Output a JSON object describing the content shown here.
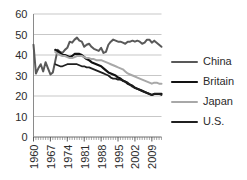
{
  "chart_data": {
    "type": "line",
    "title": "",
    "subtitle": "",
    "xlabel": "",
    "ylabel": "",
    "ylim": [
      0,
      60
    ],
    "ytick_values": [
      0,
      10,
      20,
      30,
      40,
      50,
      60
    ],
    "ytick_labels": [
      "0",
      "10",
      "20",
      "30",
      "40",
      "50",
      "60"
    ],
    "xlim": [
      1960,
      2013
    ],
    "xtick_labels": [
      "1960",
      "1967",
      "1974",
      "1981",
      "1988",
      "1995",
      "2002",
      "2009"
    ],
    "xtick_values": [
      1960,
      1967,
      1974,
      1981,
      1988,
      1995,
      2002,
      2009
    ],
    "x": [
      1960,
      1961,
      1962,
      1963,
      1964,
      1965,
      1966,
      1967,
      1968,
      1969,
      1970,
      1971,
      1972,
      1973,
      1974,
      1975,
      1976,
      1977,
      1978,
      1979,
      1980,
      1981,
      1982,
      1983,
      1984,
      1985,
      1986,
      1987,
      1988,
      1989,
      1990,
      1991,
      1992,
      1993,
      1994,
      1995,
      1996,
      1997,
      1998,
      1999,
      2000,
      2001,
      2002,
      2003,
      2004,
      2005,
      2006,
      2007,
      2008,
      2009,
      2010,
      2011,
      2012,
      2013
    ],
    "grid": "horizontal",
    "legend_position": "right",
    "series": [
      {
        "name": "China",
        "color": "#595959",
        "width": 2.0,
        "values": [
          45.0,
          31.0,
          33.5,
          35.5,
          32.0,
          36.5,
          33.5,
          30.5,
          31.5,
          37.0,
          42.5,
          41.5,
          41.0,
          42.5,
          43.5,
          46.5,
          46.0,
          47.5,
          48.5,
          47.0,
          46.5,
          44.0,
          45.0,
          45.5,
          44.0,
          43.0,
          42.5,
          42.0,
          43.5,
          41.0,
          41.5,
          45.0,
          46.5,
          47.5,
          47.0,
          46.5,
          46.5,
          46.0,
          45.5,
          46.5,
          46.5,
          47.0,
          46.5,
          47.0,
          46.5,
          45.5,
          46.0,
          47.5,
          47.5,
          46.0,
          47.0,
          46.0,
          45.0,
          44.0
        ]
      },
      {
        "name": "Britain",
        "color": "#121212",
        "width": 2.2,
        "values": [
          null,
          null,
          null,
          null,
          null,
          null,
          null,
          null,
          null,
          42.5,
          42.0,
          41.0,
          40.0,
          40.0,
          39.5,
          39.0,
          39.5,
          40.5,
          40.5,
          40.5,
          40.0,
          39.0,
          38.0,
          37.5,
          36.5,
          36.0,
          35.5,
          35.0,
          34.5,
          33.5,
          32.5,
          31.5,
          31.0,
          30.5,
          30.0,
          29.0,
          28.5,
          27.5,
          27.0,
          26.0,
          25.5,
          25.0,
          24.0,
          23.5,
          23.0,
          22.5,
          22.0,
          21.5,
          21.0,
          20.5,
          21.0,
          21.0,
          21.0,
          21.0
        ]
      },
      {
        "name": "Japan",
        "color": "#a8a8a8",
        "width": 2.0,
        "values": [
          null,
          null,
          null,
          null,
          null,
          null,
          null,
          null,
          null,
          41.5,
          40.5,
          40.0,
          39.5,
          39.5,
          39.0,
          38.5,
          38.5,
          39.0,
          39.5,
          39.5,
          39.5,
          39.0,
          38.5,
          38.5,
          38.0,
          38.0,
          37.5,
          37.5,
          37.5,
          37.0,
          36.5,
          36.0,
          35.5,
          35.0,
          34.5,
          34.0,
          33.5,
          33.0,
          32.0,
          31.0,
          30.5,
          30.0,
          29.5,
          29.0,
          28.5,
          28.0,
          27.5,
          27.0,
          26.5,
          26.0,
          26.5,
          26.5,
          26.0,
          26.0
        ]
      },
      {
        "name": "U.S.",
        "color": "#1f1f1f",
        "width": 1.8,
        "values": [
          null,
          null,
          null,
          null,
          null,
          null,
          null,
          null,
          null,
          35.5,
          35.0,
          34.5,
          34.5,
          35.0,
          35.5,
          35.5,
          35.5,
          35.5,
          35.5,
          35.0,
          34.5,
          34.5,
          34.0,
          34.0,
          33.5,
          33.0,
          32.5,
          32.0,
          31.5,
          31.0,
          30.5,
          30.0,
          29.0,
          28.5,
          28.5,
          28.0,
          28.0,
          27.5,
          27.0,
          26.5,
          25.5,
          24.5,
          24.0,
          23.5,
          23.0,
          22.5,
          22.0,
          21.5,
          21.0,
          20.5,
          21.0,
          21.0,
          21.0,
          20.5
        ]
      }
    ]
  },
  "legend": {
    "entries": [
      {
        "label": "China"
      },
      {
        "label": "Britain"
      },
      {
        "label": "Japan"
      },
      {
        "label": "U.S."
      }
    ]
  }
}
